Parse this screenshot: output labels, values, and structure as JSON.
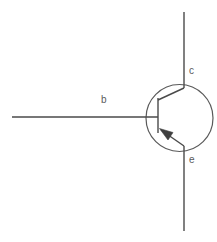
{
  "diagram": {
    "device_type": "PNP transistor",
    "background_color": "#ffffff",
    "line_color": "#4a4a4a",
    "envelope_color": "#5a5a5a",
    "label_color": "#5b5b5b",
    "terminals": [
      {
        "id": "collector",
        "label": "c",
        "label_x": 189,
        "label_y": 66,
        "lead": {
          "x1": 184,
          "y1": 12,
          "x2": 184,
          "y2": 88
        },
        "internal": {
          "x1": 184,
          "y1": 88,
          "x2": 158,
          "y2": 100
        }
      },
      {
        "id": "base",
        "label": "b",
        "label_x": 101,
        "label_y": 95,
        "lead": {
          "x1": 12,
          "y1": 117,
          "x2": 158,
          "y2": 117
        },
        "bar": {
          "x1": 158,
          "y1": 98,
          "x2": 158,
          "y2": 133
        }
      },
      {
        "id": "emitter",
        "label": "e",
        "label_x": 189,
        "label_y": 155,
        "lead": {
          "x1": 184,
          "y1": 146,
          "x2": 184,
          "y2": 231
        },
        "internal": {
          "x1": 184,
          "y1": 146,
          "x2": 161,
          "y2": 130
        },
        "arrow": {
          "direction": "toward-base",
          "tip_x": 160,
          "tip_y": 129,
          "points": "160,129 172,132 168,139"
        }
      }
    ],
    "envelope": {
      "shape": "circle",
      "cx": 179.5,
      "cy": 118,
      "r": 33.5
    }
  }
}
